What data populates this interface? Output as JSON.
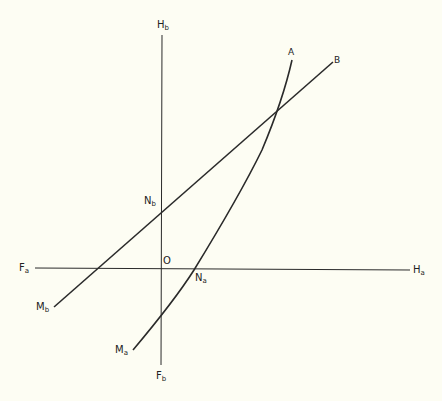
{
  "diagram": {
    "type": "geometric-construction",
    "colors": {
      "background": "#fdfdf3",
      "stroke": "#2a2a2a"
    },
    "labels": {
      "Hb": {
        "main": "H",
        "sub": "b"
      },
      "A": {
        "main": "A",
        "sub": ""
      },
      "B": {
        "main": "B",
        "sub": ""
      },
      "Nb": {
        "main": "N",
        "sub": "b"
      },
      "O": {
        "main": "O",
        "sub": ""
      },
      "Fa": {
        "main": "F",
        "sub": "a"
      },
      "Ha": {
        "main": "H",
        "sub": "a"
      },
      "Na": {
        "main": "N",
        "sub": "a"
      },
      "Mb": {
        "main": "M",
        "sub": "b"
      },
      "Ma": {
        "main": "M",
        "sub": "a"
      },
      "Fb": {
        "main": "F",
        "sub": "b"
      }
    },
    "elements": [
      {
        "name": "vertical-axis",
        "from": "Fb",
        "to": "Hb"
      },
      {
        "name": "horizontal-axis",
        "from": "Fa",
        "to": "Ha"
      },
      {
        "name": "straight-line",
        "from": "Mb",
        "to": "B",
        "passes_through": [
          "Nb"
        ]
      },
      {
        "name": "curve",
        "from": "Ma",
        "to": "A",
        "passes_through": [
          "Na"
        ]
      }
    ]
  }
}
